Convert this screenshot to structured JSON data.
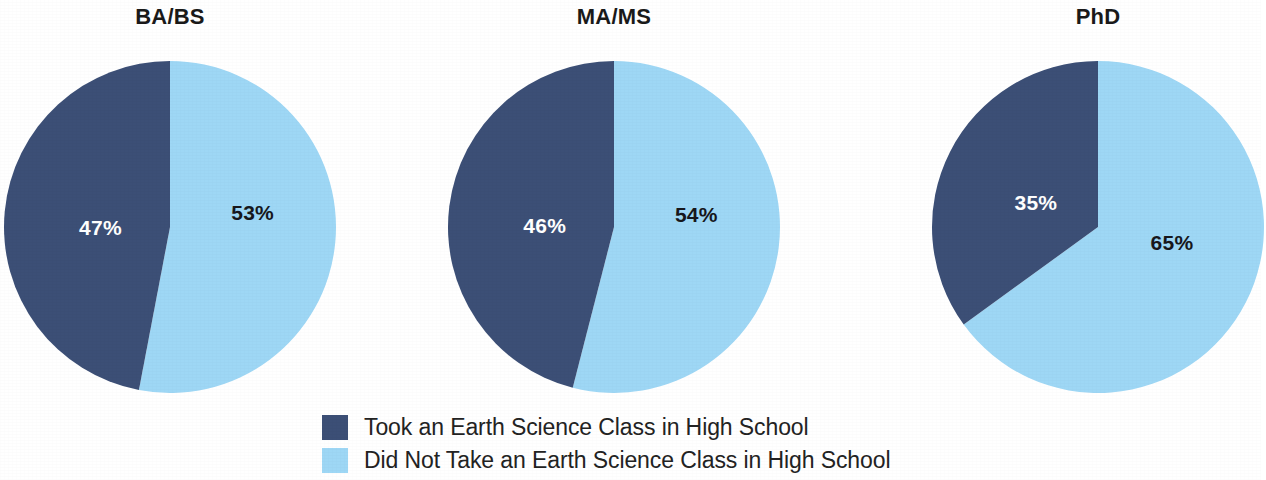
{
  "colors": {
    "took_class": "#3c4f76",
    "did_not_take_class": "#9ed7f5",
    "title_text": "#1a1a1a",
    "legend_text": "#232323",
    "background": "#ffffff"
  },
  "legend": {
    "items": [
      {
        "label": "Took an Earth Science Class in High School",
        "color": "#3c4f76"
      },
      {
        "label": "Did Not Take an Earth Science Class in High School",
        "color": "#9ed7f5"
      }
    ]
  },
  "charts": [
    {
      "title": "BA/BS",
      "labels": [
        "47%",
        "53%"
      ],
      "center_x": 170,
      "center_y": 227,
      "radius": 166
    },
    {
      "title": "MA/MS",
      "labels": [
        "46%",
        "54%"
      ],
      "center_x": 614,
      "center_y": 227,
      "radius": 166
    },
    {
      "title": "PhD",
      "labels": [
        "35%",
        "65%"
      ],
      "center_x": 1098,
      "center_y": 227,
      "radius": 166
    }
  ],
  "chart_data": {
    "type": "pie",
    "title": "",
    "subtitle": "",
    "legend_position": "bottom-center",
    "legend": [
      "Took an Earth Science Class in High School",
      "Did Not Take an Earth Science Class in High School"
    ],
    "value_unit": "percent",
    "panels": [
      {
        "title": "BA/BS",
        "categories": [
          "Took an Earth Science Class in High School",
          "Did Not Take an Earth Science Class in High School"
        ],
        "values": [
          47,
          53
        ],
        "data_labels": [
          "47%",
          "53%"
        ],
        "colors": [
          "#3c4f76",
          "#9ed7f5"
        ]
      },
      {
        "title": "MA/MS",
        "categories": [
          "Took an Earth Science Class in High School",
          "Did Not Take an Earth Science Class in High School"
        ],
        "values": [
          46,
          54
        ],
        "data_labels": [
          "46%",
          "54%"
        ],
        "colors": [
          "#3c4f76",
          "#9ed7f5"
        ]
      },
      {
        "title": "PhD",
        "categories": [
          "Took an Earth Science Class in High School",
          "Did Not Take an Earth Science Class in High School"
        ],
        "values": [
          35,
          65
        ],
        "data_labels": [
          "35%",
          "65%"
        ],
        "colors": [
          "#3c4f76",
          "#9ed7f5"
        ]
      }
    ]
  }
}
